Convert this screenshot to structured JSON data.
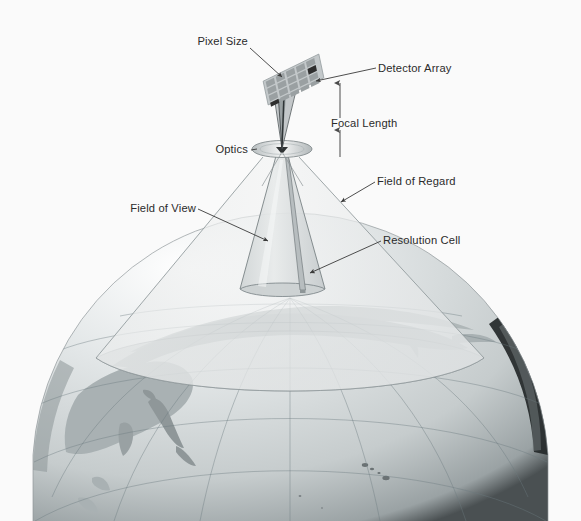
{
  "figure": {
    "background_color": "#fafafa",
    "width": 581,
    "height": 521
  },
  "labels": {
    "pixel_size": "Pixel Size",
    "detector_array": "Detector Array",
    "focal_length": "Focal Length",
    "optics": "Optics",
    "field_of_view": "Field of View",
    "field_of_regard": "Field of Regard",
    "resolution_cell": "Resolution Cell"
  },
  "elements": {
    "detector_array_grid": "5x5 tilted pixel grid",
    "highlighted_pixel": "single dark corner pixel",
    "optics_lens": "ellipse lens element",
    "focal_length_arrow": "double-headed vertical dimension arrow",
    "fov_cone": "narrow translucent cone from optics to earth surface",
    "for_cone": "wide translucent cone from optics to earth surface",
    "resolution_cell_sliver": "narrow vertical sliver inside field of view cone",
    "globe": "earth sphere showing asia pacific region with graticule"
  },
  "colors": {
    "background": "#fafafa",
    "text": "#2b2b2b",
    "leader_line": "#3a3a3a",
    "cone_fill": "#d8dcdc",
    "cone_stroke": "#8a9396",
    "ocean": "#c9ced0",
    "land": "#a8b0b2",
    "graticule": "#6d7a80",
    "detector_pixel": "#9aa0a2",
    "detector_pixel_dark": "#2e2e2e",
    "globe_limb_dark": "#1c1c1c"
  }
}
